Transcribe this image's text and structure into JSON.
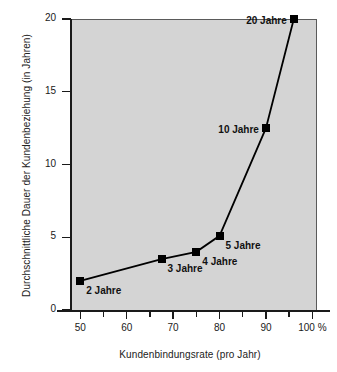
{
  "chart_data": {
    "type": "line",
    "title": "",
    "xlabel": "Kundenbindungsrate (pro Jahr)",
    "ylabel": "Durchschnittliche Dauer der Kundenbeziehung (in Jahren)",
    "xlim": [
      48,
      101
    ],
    "ylim": [
      0,
      20
    ],
    "grid": false,
    "legend": "none",
    "background_color": "#d4d4d4",
    "line_color": "#000000",
    "marker_color": "#000000",
    "marker_shape": "square",
    "x_ticks": [
      {
        "value": 50,
        "label": "50",
        "major": true
      },
      {
        "value": 55,
        "label": "",
        "major": false
      },
      {
        "value": 60,
        "label": "60",
        "major": true
      },
      {
        "value": 65,
        "label": "",
        "major": false
      },
      {
        "value": 70,
        "label": "70",
        "major": true
      },
      {
        "value": 75,
        "label": "",
        "major": false
      },
      {
        "value": 80,
        "label": "80",
        "major": true
      },
      {
        "value": 85,
        "label": "",
        "major": false
      },
      {
        "value": 90,
        "label": "90",
        "major": true
      },
      {
        "value": 95,
        "label": "",
        "major": false
      },
      {
        "value": 100,
        "label": "100 %",
        "major": true
      }
    ],
    "y_ticks": [
      {
        "value": 0,
        "label": "0"
      },
      {
        "value": 5,
        "label": "5"
      },
      {
        "value": 10,
        "label": "10"
      },
      {
        "value": 15,
        "label": "15"
      },
      {
        "value": 20,
        "label": "20"
      }
    ],
    "points": [
      {
        "x": 50,
        "y": 2,
        "label": "2 Jahre",
        "label_side": "right"
      },
      {
        "x": 67.5,
        "y": 3.5,
        "label": "3 Jahre",
        "label_side": "right"
      },
      {
        "x": 75,
        "y": 4,
        "label": "4 Jahre",
        "label_side": "right"
      },
      {
        "x": 80,
        "y": 5.1,
        "label": "5 Jahre",
        "label_side": "right"
      },
      {
        "x": 90,
        "y": 12.5,
        "label": "10 Jahre",
        "label_side": "left"
      },
      {
        "x": 96,
        "y": 20,
        "label": "20 Jahre",
        "label_side": "left"
      }
    ]
  }
}
